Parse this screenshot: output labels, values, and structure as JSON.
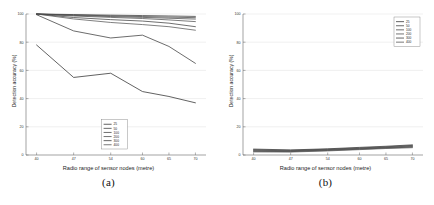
{
  "figure": {
    "panels": [
      {
        "caption": "(a)",
        "xlabel": "Radio range of sensor nodes (metre)",
        "ylabel": "Detection accuracy (%)"
      },
      {
        "caption": "(b)",
        "xlabel": "Radio range of sensor nodes (metre)",
        "ylabel": "Detection accuracy (%)"
      }
    ]
  },
  "chart_data": [
    {
      "type": "line",
      "panel": "(a)",
      "title": "",
      "xlabel": "Radio range of sensor nodes (metre)",
      "ylabel": "Detection accuracy (%)",
      "x": [
        40,
        47,
        54,
        60,
        65,
        70
      ],
      "xticks": [
        40,
        47,
        54,
        60,
        65,
        70
      ],
      "xticklabels": [
        "40",
        "47",
        "54",
        "60",
        "65",
        "70"
      ],
      "yticks": [
        0,
        20,
        40,
        60,
        80,
        100
      ],
      "yticklabels": [
        "0",
        "20",
        "40",
        "60",
        "80",
        "100"
      ],
      "xlim": [
        38,
        72
      ],
      "ylim": [
        0,
        100
      ],
      "grid": true,
      "legend_position": "lower-center",
      "series": [
        {
          "name": "25",
          "color": "#3a3a3a",
          "values": [
            100,
            99.6,
            99.2,
            98.9,
            98.6,
            98.3
          ]
        },
        {
          "name": "50",
          "color": "#444444",
          "values": [
            100,
            99.3,
            98.7,
            98.2,
            97.8,
            97.4
          ]
        },
        {
          "name": "100",
          "color": "#4a4a4a",
          "values": [
            100,
            99.0,
            98.2,
            97.6,
            97.0,
            96.4
          ]
        },
        {
          "name": "200",
          "color": "#505050",
          "values": [
            100,
            98.6,
            97.6,
            96.8,
            95.8,
            94.6
          ]
        },
        {
          "name": "300",
          "color": "#3f3f3f",
          "values": [
            100,
            97.5,
            96.0,
            95.0,
            93.5,
            91.0
          ]
        },
        {
          "name": "400",
          "color": "#555555",
          "values": [
            100,
            96.5,
            94.0,
            92.5,
            91.0,
            88.5
          ]
        },
        {
          "name": "mid",
          "color": "#3b3b3b",
          "values": [
            99.5,
            88.0,
            83.0,
            85.0,
            77.0,
            65.0
          ]
        },
        {
          "name": "low",
          "color": "#2e2e2e",
          "values": [
            78.0,
            55.0,
            58.0,
            45.0,
            41.5,
            37.0
          ]
        }
      ]
    },
    {
      "type": "line",
      "panel": "(b)",
      "title": "",
      "xlabel": "Radio range of sensor nodes (metre)",
      "ylabel": "Detection accuracy (%)",
      "x": [
        40,
        47,
        54,
        60,
        65,
        70
      ],
      "xticks": [
        40,
        47,
        54,
        60,
        65,
        70
      ],
      "xticklabels": [
        "40",
        "47",
        "54",
        "60",
        "65",
        "70"
      ],
      "yticks": [
        0,
        20,
        40,
        60,
        80,
        100
      ],
      "yticklabels": [
        "0",
        "20",
        "40",
        "60",
        "80",
        "100"
      ],
      "xlim": [
        38,
        72
      ],
      "ylim": [
        0,
        100
      ],
      "grid": true,
      "legend_position": "upper-right",
      "series": [
        {
          "name": "25",
          "color": "#3a3a3a",
          "values": [
            4.2,
            3.6,
            4.4,
            5.4,
            6.2,
            7.2
          ]
        },
        {
          "name": "50",
          "color": "#444444",
          "values": [
            3.8,
            3.3,
            4.1,
            5.0,
            5.8,
            6.8
          ]
        },
        {
          "name": "100",
          "color": "#4a4a4a",
          "values": [
            3.4,
            3.0,
            3.8,
            4.7,
            5.5,
            6.4
          ]
        },
        {
          "name": "200",
          "color": "#505050",
          "values": [
            3.0,
            2.7,
            3.5,
            4.4,
            5.2,
            6.0
          ]
        },
        {
          "name": "300",
          "color": "#3f3f3f",
          "values": [
            2.6,
            2.4,
            3.2,
            4.1,
            4.9,
            5.6
          ]
        },
        {
          "name": "400",
          "color": "#555555",
          "values": [
            2.2,
            2.1,
            2.9,
            3.8,
            4.6,
            5.2
          ]
        }
      ]
    }
  ]
}
